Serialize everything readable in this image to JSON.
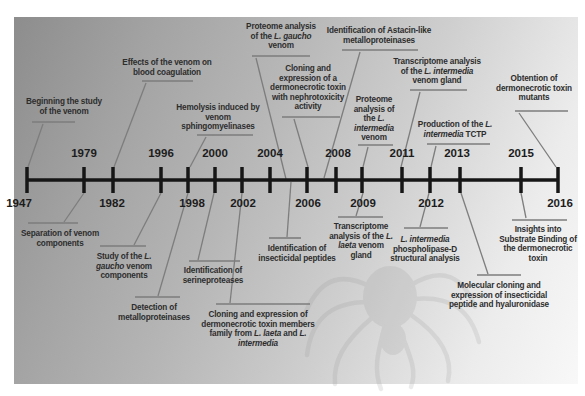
{
  "figure": {
    "type": "timeline-diagram"
  },
  "colors": {
    "background": "#ffffff",
    "panel_dark": "#8d8d8d",
    "panel_light": "#f8f8f8",
    "timeline": "#161616",
    "year_text": "#1c1c1c",
    "event_text": "#2d2d2d",
    "connector": "#7d7d7d",
    "watermark": "#8a8a8a"
  },
  "timeline": {
    "x1": 27,
    "x2": 558,
    "y": 180,
    "tick_top": 167,
    "tick_bottom": 193,
    "thickness": 3.5,
    "tick_width": 3.5
  },
  "years": [
    {
      "label": "1947",
      "x": 27,
      "label_x": 19,
      "side": "below"
    },
    {
      "label": "1979",
      "x": 84,
      "label_x": 84,
      "side": "above"
    },
    {
      "label": "1982",
      "x": 113,
      "label_x": 112,
      "side": "below"
    },
    {
      "label": "1996",
      "x": 161,
      "label_x": 161,
      "side": "above"
    },
    {
      "label": "1998",
      "x": 188,
      "label_x": 192,
      "side": "below"
    },
    {
      "label": "2000",
      "x": 215,
      "label_x": 215,
      "side": "above"
    },
    {
      "label": "2002",
      "x": 242,
      "label_x": 243,
      "side": "below"
    },
    {
      "label": "2004",
      "x": 270,
      "label_x": 270,
      "side": "above"
    },
    {
      "label": "2006",
      "x": 307,
      "label_x": 308,
      "side": "below"
    },
    {
      "label": "2008",
      "x": 336,
      "label_x": 338,
      "side": "above"
    },
    {
      "label": "2009",
      "x": 362,
      "label_x": 363,
      "side": "below"
    },
    {
      "label": "2011",
      "x": 402,
      "label_x": 402,
      "side": "above"
    },
    {
      "label": "2012",
      "x": 430,
      "label_x": 431,
      "side": "below"
    },
    {
      "label": "2013",
      "x": 460,
      "label_x": 457,
      "side": "above"
    },
    {
      "label": "2015",
      "x": 521,
      "label_x": 521,
      "side": "above"
    },
    {
      "label": "2016",
      "x": 558,
      "label_x": 560,
      "side": "below"
    }
  ],
  "events": [
    {
      "id": "beginning-study",
      "side": "above",
      "lines": [
        "Beginning the study",
        "of the venom"
      ],
      "cx": 64,
      "top": 97,
      "rule": [
        32,
        75,
        122
      ],
      "connector": [
        43,
        124,
        28,
        167
      ]
    },
    {
      "id": "effects-coagulation",
      "side": "above",
      "lines": [
        "Effects of the venom on",
        "blood coagulation"
      ],
      "cx": 167,
      "top": 58,
      "rule": [
        142,
        193,
        81
      ],
      "connector": [
        146,
        83,
        114,
        167
      ]
    },
    {
      "id": "hemolysis-sphingo",
      "side": "above",
      "lines": [
        "Hemolysis induced by",
        "venom",
        "sphingomyelinases"
      ],
      "cx": 218,
      "top": 103,
      "rule": [
        197,
        253,
        135
      ],
      "connector": [
        206,
        137,
        190,
        167
      ]
    },
    {
      "id": "proteome-gaucho",
      "side": "above",
      "lines": [
        "Proteome analysis",
        "of the L. gaucho",
        "venom"
      ],
      "cx": 281,
      "top": 22,
      "rule": [
        252,
        310,
        56
      ],
      "connector": [
        256,
        58,
        286,
        179
      ]
    },
    {
      "id": "cloning-nephrotoxic",
      "side": "above",
      "lines": [
        "Cloning and",
        "expression of a",
        "dermonecrotic toxin",
        "with nephrotoxicity",
        "activity"
      ],
      "cx": 308,
      "top": 64,
      "rule": [
        282,
        340,
        117
      ],
      "connector": [
        294,
        119,
        308,
        167
      ]
    },
    {
      "id": "astacin-metallo",
      "side": "above",
      "lines": [
        "Identification of Astacin-like",
        "metalloproteinases"
      ],
      "cx": 379,
      "top": 26,
      "rule": [
        342,
        418,
        50
      ],
      "connector": [
        360,
        52,
        324,
        178
      ]
    },
    {
      "id": "proteome-intermedia",
      "side": "above",
      "lines": [
        "Proteome",
        "analysis of",
        "the L.",
        "intermedia",
        "venom"
      ],
      "cx": 374,
      "top": 95,
      "rule": [
        358,
        393,
        145
      ],
      "connector": [
        368,
        147,
        363,
        167
      ]
    },
    {
      "id": "transcriptome-intermedia",
      "side": "above",
      "lines": [
        "Transcriptome analysis",
        "of the L. intermedia",
        "venom gland"
      ],
      "cx": 437,
      "top": 57,
      "rule": [
        410,
        467,
        90
      ],
      "connector": [
        420,
        92,
        401,
        167
      ]
    },
    {
      "id": "production-tctp",
      "side": "above",
      "lines": [
        "Production of the L.",
        "intermedia TCTP"
      ],
      "cx": 455,
      "top": 120,
      "rule": [
        427,
        490,
        144
      ],
      "connector": [
        436,
        146,
        431,
        167
      ]
    },
    {
      "id": "obtention-mutants",
      "side": "above",
      "lines": [
        "Obtention of",
        "dermonecrotic toxin",
        "mutants"
      ],
      "cx": 534,
      "top": 74,
      "rule": [
        515,
        568,
        111
      ],
      "connector": [
        519,
        113,
        556,
        167
      ]
    },
    {
      "id": "separation-components",
      "side": "below",
      "lines": [
        "Separation of venom",
        "components"
      ],
      "cx": 60,
      "top": 229,
      "rule": [
        28,
        78,
        223
      ],
      "connector": [
        64,
        222,
        84,
        193
      ]
    },
    {
      "id": "study-gaucho",
      "side": "below",
      "lines": [
        "Study of the L.",
        "gaucho venom",
        "components"
      ],
      "cx": 124,
      "top": 252,
      "rule": [
        100,
        146,
        246
      ],
      "connector": [
        134,
        245,
        161,
        193
      ]
    },
    {
      "id": "detection-metallo",
      "side": "below",
      "lines": [
        "Detection of",
        "metalloproteinases"
      ],
      "cx": 154,
      "top": 303,
      "rule": [
        135,
        180,
        297
      ],
      "connector": [
        158,
        296,
        188,
        193
      ]
    },
    {
      "id": "serineproteases",
      "side": "below",
      "lines": [
        "Identification of",
        "serineproteases"
      ],
      "cx": 213,
      "top": 266,
      "rule": [
        189,
        240,
        261
      ],
      "connector": [
        198,
        260,
        214,
        193
      ]
    },
    {
      "id": "cloning-members",
      "side": "below",
      "lines": [
        "Cloning and expression of",
        "dermonecrotic toxin members",
        "family from L. laeta and L.",
        "intermedia"
      ],
      "cx": 258,
      "top": 310,
      "rule": [
        216,
        310,
        304
      ],
      "connector": [
        230,
        303,
        242,
        193
      ]
    },
    {
      "id": "insecticidal-peptides",
      "side": "below",
      "lines": [
        "Identification of",
        "insecticidal peptides"
      ],
      "cx": 297,
      "top": 244,
      "rule": [
        269,
        301,
        238
      ],
      "connector": [
        287,
        237,
        291,
        182
      ]
    },
    {
      "id": "transcriptome-laeta",
      "side": "below",
      "lines": [
        "Transcriptome",
        "analysis of the L.",
        "laeta venom",
        "gland"
      ],
      "cx": 361,
      "top": 222,
      "rule": [
        338,
        383,
        217
      ],
      "connector": [
        356,
        216,
        363,
        193
      ]
    },
    {
      "id": "phospholipase-d",
      "side": "below",
      "lines": [
        "L. intermedia",
        "phospholipase-D",
        "structural analysis"
      ],
      "cx": 425,
      "top": 235,
      "rule": [
        404,
        448,
        228
      ],
      "connector": [
        420,
        227,
        429,
        193
      ]
    },
    {
      "id": "molecular-cloning",
      "side": "below",
      "lines": [
        "Molecular cloning and",
        "expression of insecticidal",
        "peptide and hyaluronidase"
      ],
      "cx": 499,
      "top": 281,
      "rule": [
        477,
        521,
        275
      ],
      "connector": [
        488,
        274,
        461,
        193
      ]
    },
    {
      "id": "insights-binding",
      "side": "below",
      "lines": [
        "Insights into",
        "Substrate Binding of",
        "the dermonecrotic",
        "toxin"
      ],
      "cx": 538,
      "top": 225,
      "rule": [
        512,
        567,
        220
      ],
      "connector": [
        526,
        218,
        521,
        193
      ]
    }
  ],
  "watermark": {
    "icon": "spider-watermark",
    "opacity": 0.16
  }
}
